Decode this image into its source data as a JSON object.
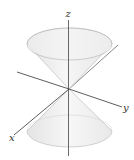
{
  "diagram": {
    "type": "double-cone-3d",
    "axes": {
      "x_label": "x",
      "y_label": "y",
      "z_label": "z"
    },
    "colors": {
      "cone_fill": "#eeeeee",
      "cone_fill_light": "#f7f7f7",
      "cone_edge": "#b5b5b5",
      "axis": "#333333",
      "background": "#ffffff"
    }
  }
}
